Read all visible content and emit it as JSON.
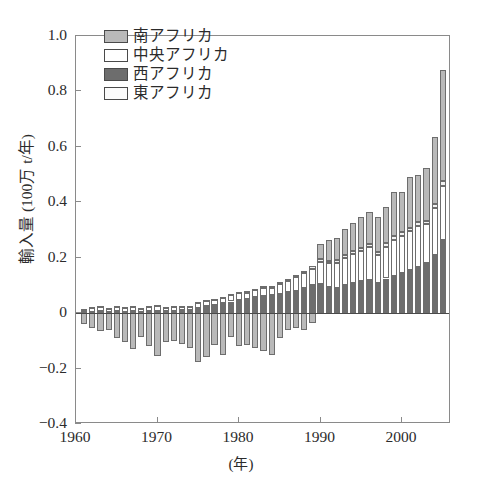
{
  "chart_data": {
    "type": "bar",
    "stacked": true,
    "title": "",
    "xlabel": "(年)",
    "ylabel": "輸入量 (100万 t/年)",
    "xlim": [
      1960,
      2006
    ],
    "ylim": [
      -0.4,
      1.0
    ],
    "ytick_labels": [
      "1.0",
      "0.8",
      "0.6",
      "0.4",
      "0.2",
      "0",
      "−0.2",
      "−0.4"
    ],
    "ytick_values": [
      1.0,
      0.8,
      0.6,
      0.4,
      0.2,
      0,
      -0.2,
      -0.4
    ],
    "xtick_labels": [
      "1960",
      "1970",
      "1980",
      "1990",
      "2000"
    ],
    "xtick_values": [
      1960,
      1970,
      1980,
      1990,
      2000
    ],
    "grid": false,
    "legend_position": "top-left",
    "x": [
      1961,
      1962,
      1963,
      1964,
      1965,
      1966,
      1967,
      1968,
      1969,
      1970,
      1971,
      1972,
      1973,
      1974,
      1975,
      1976,
      1977,
      1978,
      1979,
      1980,
      1981,
      1982,
      1983,
      1984,
      1985,
      1986,
      1987,
      1988,
      1989,
      1990,
      1991,
      1992,
      1993,
      1994,
      1995,
      1996,
      1997,
      1998,
      1999,
      2000,
      2001,
      2002,
      2003,
      2004,
      2005
    ],
    "series": [
      {
        "name": "南アフリカ",
        "color": "#b9b9b9",
        "values": [
          -0.04,
          -0.055,
          -0.065,
          -0.06,
          -0.09,
          -0.105,
          -0.13,
          -0.085,
          -0.12,
          -0.155,
          -0.105,
          -0.1,
          -0.11,
          -0.125,
          -0.175,
          -0.16,
          -0.115,
          -0.15,
          -0.085,
          -0.12,
          -0.115,
          -0.125,
          -0.135,
          -0.15,
          -0.09,
          -0.06,
          -0.055,
          -0.06,
          -0.035,
          0.055,
          0.075,
          0.08,
          0.095,
          0.1,
          0.11,
          0.115,
          0.125,
          0.13,
          0.16,
          0.145,
          0.185,
          0.17,
          0.19,
          0.24,
          0.4
        ]
      },
      {
        "name": "中央アフリカ",
        "color": "#ffffff",
        "values": [
          0.01,
          0.014,
          0.016,
          0.013,
          0.018,
          0.015,
          0.016,
          0.012,
          0.015,
          0.018,
          0.013,
          0.016,
          0.014,
          0.012,
          0.018,
          0.02,
          0.016,
          0.018,
          0.022,
          0.025,
          0.022,
          0.024,
          0.03,
          0.026,
          0.035,
          0.04,
          0.05,
          0.055,
          0.06,
          0.08,
          0.085,
          0.09,
          0.1,
          0.105,
          0.11,
          0.12,
          0.1,
          0.115,
          0.13,
          0.135,
          0.14,
          0.15,
          0.14,
          0.17,
          0.195
        ]
      },
      {
        "name": "西アフリカ",
        "color": "#6d6d6d",
        "values": [
          0.004,
          0.005,
          0.006,
          0.005,
          0.006,
          0.005,
          0.006,
          0.005,
          0.006,
          0.007,
          0.006,
          0.008,
          0.01,
          0.012,
          0.018,
          0.024,
          0.03,
          0.036,
          0.042,
          0.048,
          0.052,
          0.058,
          0.062,
          0.066,
          0.07,
          0.075,
          0.08,
          0.09,
          0.1,
          0.105,
          0.095,
          0.09,
          0.1,
          0.11,
          0.115,
          0.12,
          0.11,
          0.125,
          0.135,
          0.145,
          0.155,
          0.165,
          0.18,
          0.21,
          0.265
        ]
      },
      {
        "name": "東アフリカ",
        "color": "#f2f2f2",
        "values": [
          0.002,
          0.002,
          0.003,
          0.002,
          0.003,
          0.002,
          0.003,
          0.002,
          0.003,
          0.003,
          0.003,
          0.003,
          0.003,
          0.003,
          0.004,
          0.004,
          0.004,
          0.005,
          0.005,
          0.005,
          0.005,
          0.006,
          0.006,
          0.006,
          0.007,
          0.007,
          0.008,
          0.008,
          0.009,
          0.009,
          0.009,
          0.01,
          0.01,
          0.01,
          0.011,
          0.011,
          0.011,
          0.012,
          0.012,
          0.013,
          0.013,
          0.014,
          0.014,
          0.015,
          0.016
        ]
      }
    ]
  },
  "legend": {
    "items": [
      {
        "label": "南アフリカ",
        "color": "#b9b9b9"
      },
      {
        "label": "中央アフリカ",
        "color": "#ffffff"
      },
      {
        "label": "西アフリカ",
        "color": "#6d6d6d"
      },
      {
        "label": "東アフリカ",
        "color": "#fbfbfb"
      }
    ]
  },
  "axes": {
    "y_title": "輸入量 (100万 t/年)",
    "x_title": "(年)"
  }
}
